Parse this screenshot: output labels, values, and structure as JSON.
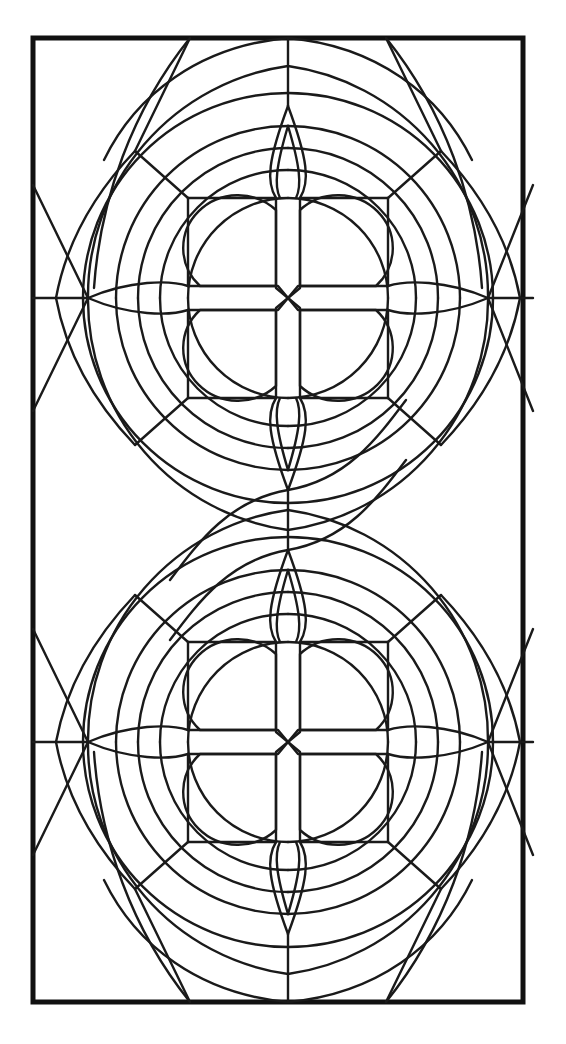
{
  "document": {
    "title": "Stained Glass Window Pattern",
    "subject": "leaded-glass panel line drawing",
    "orientation": "portrait",
    "background_color": "#ffffff",
    "line_color": "#1a1a1a",
    "canvas": {
      "width": 566,
      "height": 1044
    }
  },
  "frame": {
    "name": "outer-border-rectangle",
    "x": 33,
    "y": 38,
    "width": 490,
    "height": 964,
    "stroke_width": 5,
    "color": "#111111"
  },
  "geometry": {
    "center_x": 288,
    "medallion_centers_y": [
      298,
      742
    ],
    "waist_y": 520,
    "inner_square": {
      "left": 188,
      "right": 388,
      "half": 100
    },
    "ring_radii": [
      100,
      128,
      150,
      172,
      205,
      232
    ],
    "petal_radius": 52,
    "lens_half_length": 100,
    "lens_half_width": 16,
    "vertical_leaf_half_length": 96,
    "vertical_leaf_half_width": 18,
    "cross_arm_half_width": 12,
    "cross_pinch": 9,
    "side_node_x": [
      88,
      488
    ],
    "edge_tick_y_top": [
      185,
      411
    ],
    "edge_tick_y_bottom": [
      629,
      855
    ],
    "corner_nodes": [
      {
        "x": 135,
        "y": 445
      },
      {
        "x": 441,
        "y": 445
      },
      {
        "x": 135,
        "y": 595
      },
      {
        "x": 441,
        "y": 595
      }
    ],
    "top_edge_nodes_x": [
      190,
      288,
      386
    ],
    "bottom_edge_nodes_x": [
      190,
      288,
      386
    ]
  },
  "palette": {
    "stroke": "#1a1a1a",
    "stroke_heavy": "#111111",
    "fill": "none",
    "page": "#ffffff"
  },
  "chart_data": {
    "type": "table",
    "categories": [
      "top-medallion",
      "waist-junction",
      "bottom-medallion",
      "outer-frame"
    ],
    "values": [
      1,
      1,
      1,
      1
    ]
  }
}
